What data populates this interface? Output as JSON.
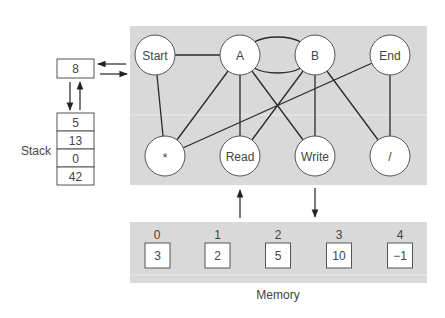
{
  "colors": {
    "panel": "#d9d9d9",
    "panel_band": "#ececec",
    "background": "#ffffff",
    "line": "#2a2a2a",
    "text": "#444444"
  },
  "register": {
    "value": "8"
  },
  "stack": {
    "label": "Stack",
    "items": [
      "5",
      "13",
      "0",
      "42"
    ]
  },
  "graph": {
    "nodes": [
      {
        "id": "start",
        "label": "Start"
      },
      {
        "id": "a",
        "label": "A"
      },
      {
        "id": "b",
        "label": "B"
      },
      {
        "id": "end",
        "label": "End"
      },
      {
        "id": "mul",
        "label": "*"
      },
      {
        "id": "read",
        "label": "Read"
      },
      {
        "id": "write",
        "label": "Write"
      },
      {
        "id": "div",
        "label": "/"
      }
    ],
    "edges": [
      [
        "start",
        "a"
      ],
      [
        "start",
        "mul"
      ],
      [
        "a",
        "mul"
      ],
      [
        "a",
        "read"
      ],
      [
        "a",
        "write"
      ],
      [
        "a",
        "b"
      ],
      [
        "b",
        "read"
      ],
      [
        "b",
        "write"
      ],
      [
        "b",
        "div"
      ],
      [
        "end",
        "mul"
      ],
      [
        "end",
        "div"
      ]
    ]
  },
  "memory": {
    "label": "Memory",
    "cells": [
      {
        "index": "0",
        "value": "3"
      },
      {
        "index": "1",
        "value": "2"
      },
      {
        "index": "2",
        "value": "5"
      },
      {
        "index": "3",
        "value": "10"
      },
      {
        "index": "4",
        "value": "−1"
      }
    ]
  }
}
